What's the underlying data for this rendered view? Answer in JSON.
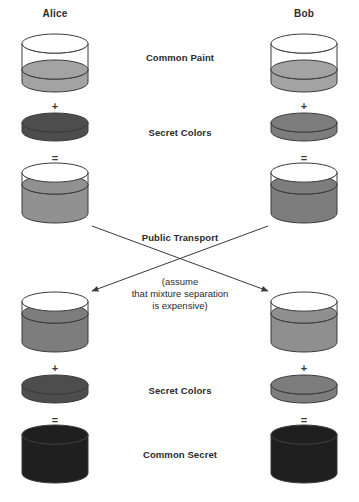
{
  "diagram": {
    "title_alice": "Alice",
    "title_bob": "Bob",
    "background_color": "#ffffff",
    "stroke_color": "#3a3a3a",
    "text_color": "#2b2b2b"
  },
  "parties": [
    {
      "name": "alice",
      "label": "Alice",
      "center_x": 55
    },
    {
      "name": "bob",
      "label": "Bob",
      "center_x": 304
    }
  ],
  "center_labels": [
    {
      "name": "common-paint",
      "text": "Common Paint",
      "y": 52
    },
    {
      "name": "secret-colors-top",
      "text": "Secret Colors",
      "y": 127
    },
    {
      "name": "public-transport",
      "text": "Public Transport",
      "y": 232
    },
    {
      "name": "secret-colors-bottom",
      "text": "Secret Colors",
      "y": 385
    },
    {
      "name": "common-secret",
      "text": "Common Secret",
      "y": 449
    }
  ],
  "note": {
    "name": "mixture-separation-note",
    "line1": "(assume",
    "line2": "that mixture separation",
    "line3": "is expensive)",
    "y": 277
  },
  "operators": [
    {
      "name": "alice-plus-top",
      "symbol": "+",
      "x": 55,
      "y": 100
    },
    {
      "name": "bob-plus-top",
      "symbol": "+",
      "x": 304,
      "y": 100
    },
    {
      "name": "alice-equals-top",
      "symbol": "=",
      "x": 55,
      "y": 152
    },
    {
      "name": "bob-equals-top",
      "symbol": "=",
      "x": 304,
      "y": 152
    },
    {
      "name": "alice-plus-bottom",
      "symbol": "+",
      "x": 55,
      "y": 362
    },
    {
      "name": "bob-plus-bottom",
      "symbol": "+",
      "x": 304,
      "y": 362
    },
    {
      "name": "alice-equals-bottom",
      "symbol": "=",
      "x": 55,
      "y": 414
    },
    {
      "name": "bob-equals-bottom",
      "symbol": "=",
      "x": 304,
      "y": 414
    }
  ],
  "vessels": [
    {
      "name": "alice-common-paint-jar",
      "kind": "jar",
      "cx": 55,
      "top": 34,
      "width": 66,
      "height": 58,
      "fill_top": 26,
      "fill_color": "#a3a3a3",
      "empty_color": "#ffffff"
    },
    {
      "name": "bob-common-paint-jar",
      "kind": "jar",
      "cx": 304,
      "top": 34,
      "width": 66,
      "height": 58,
      "fill_top": 26,
      "fill_color": "#a3a3a3",
      "empty_color": "#ffffff"
    },
    {
      "name": "alice-secret-color-disc",
      "kind": "disc",
      "cx": 55,
      "top": 113,
      "width": 66,
      "height": 28,
      "fill_color": "#4d4d4d"
    },
    {
      "name": "bob-secret-color-disc",
      "kind": "disc",
      "cx": 304,
      "top": 113,
      "width": 66,
      "height": 28,
      "fill_color": "#7c7c7c"
    },
    {
      "name": "alice-public-mix-jar",
      "kind": "jar",
      "cx": 55,
      "top": 163,
      "width": 66,
      "height": 60,
      "fill_top": 12,
      "fill_color": "#919191",
      "empty_color": "#ffffff"
    },
    {
      "name": "bob-public-mix-jar",
      "kind": "jar",
      "cx": 304,
      "top": 163,
      "width": 66,
      "height": 60,
      "fill_top": 12,
      "fill_color": "#7d7d7d",
      "empty_color": "#ffffff"
    },
    {
      "name": "alice-received-mix-jar",
      "kind": "jar",
      "cx": 55,
      "top": 292,
      "width": 66,
      "height": 60,
      "fill_top": 12,
      "fill_color": "#7d7d7d",
      "empty_color": "#ffffff"
    },
    {
      "name": "bob-received-mix-jar",
      "kind": "jar",
      "cx": 304,
      "top": 292,
      "width": 66,
      "height": 60,
      "fill_top": 12,
      "fill_color": "#8f8f8f",
      "empty_color": "#ffffff"
    },
    {
      "name": "alice-secret-color-disc-2",
      "kind": "disc",
      "cx": 55,
      "top": 375,
      "width": 66,
      "height": 28,
      "fill_color": "#4d4d4d"
    },
    {
      "name": "bob-secret-color-disc-2",
      "kind": "disc",
      "cx": 304,
      "top": 375,
      "width": 66,
      "height": 28,
      "fill_color": "#7c7c7c"
    },
    {
      "name": "alice-common-secret-jar",
      "kind": "solid",
      "cx": 55,
      "top": 425,
      "width": 66,
      "height": 58,
      "fill_color": "#1f1f1f"
    },
    {
      "name": "bob-common-secret-jar",
      "kind": "solid",
      "cx": 304,
      "top": 425,
      "width": 66,
      "height": 58,
      "fill_color": "#1f1f1f"
    }
  ],
  "arrows": [
    {
      "name": "alice-to-bob-transport-arrow",
      "from_x": 92,
      "from_y": 226,
      "to_x": 268,
      "to_y": 291
    },
    {
      "name": "bob-to-alice-transport-arrow",
      "from_x": 268,
      "from_y": 226,
      "to_x": 92,
      "to_y": 291
    }
  ]
}
